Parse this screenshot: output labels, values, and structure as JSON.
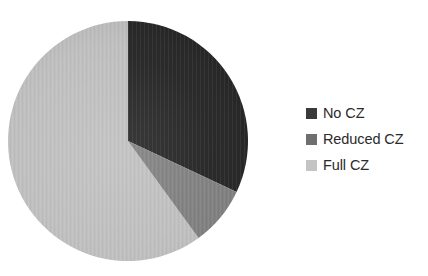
{
  "chart_data": {
    "type": "pie",
    "title": "",
    "subtitle": "",
    "xlabel": "",
    "ylabel": "",
    "grid": false,
    "legend_position": "right",
    "start_angle_deg": 0,
    "direction": "clockwise",
    "categories": [
      "No CZ",
      "Reduced CZ",
      "Full CZ"
    ],
    "values": [
      32,
      8,
      60
    ],
    "value_unit": "percent",
    "slices": [
      {
        "label": "No CZ",
        "value": 32,
        "percent": 32,
        "color": "#262626",
        "start_angle_deg": 0,
        "end_angle_deg": 115.2
      },
      {
        "label": "Reduced CZ",
        "value": 8,
        "percent": 8,
        "color": "#808080",
        "start_angle_deg": 115.2,
        "end_angle_deg": 144.0
      },
      {
        "label": "Full CZ",
        "value": 60,
        "percent": 60,
        "color": "#bfbfbf",
        "start_angle_deg": 144.0,
        "end_angle_deg": 360.0
      }
    ]
  },
  "pie": {
    "center_x": 128,
    "center_y": 141,
    "radius": 120
  },
  "legend": {
    "items": [
      {
        "label": "No CZ",
        "color": "#3a3a3a"
      },
      {
        "label": "Reduced CZ",
        "color": "#6f6f6f"
      },
      {
        "label": "Full CZ",
        "color": "#c4c4c4"
      }
    ]
  }
}
